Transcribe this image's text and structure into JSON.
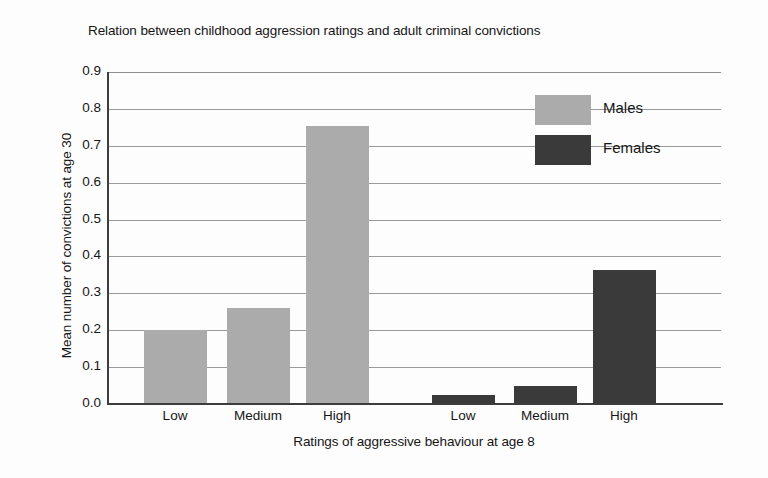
{
  "chart_data": {
    "type": "bar",
    "title": "Relation between childhood aggression ratings and adult criminal convictions",
    "xlabel": "Ratings of aggressive behaviour at age 8",
    "ylabel": "Mean number of convictions at age 30",
    "categories": [
      "Low",
      "Medium",
      "High"
    ],
    "series": [
      {
        "name": "Males",
        "values": [
          0.2,
          0.26,
          0.755
        ],
        "color": "#ababab"
      },
      {
        "name": "Females",
        "values": [
          0.025,
          0.05,
          0.363
        ],
        "color": "#3a3a3a"
      }
    ],
    "ylim": [
      0.0,
      0.9
    ],
    "ytick_labels": [
      "0.0",
      "0.1",
      "0.2",
      "0.3",
      "0.4",
      "0.5",
      "0.6",
      "0.7",
      "0.8",
      "0.9"
    ],
    "ytick_values": [
      0.0,
      0.1,
      0.2,
      0.3,
      0.4,
      0.5,
      0.6,
      0.7,
      0.8,
      0.9
    ],
    "xtick_labels": [
      "Low",
      "Medium",
      "High",
      "Low",
      "Medium",
      "High"
    ],
    "grid": true,
    "grid_axis": "y",
    "legend_position": "upper-right",
    "legend_entries": [
      "Males",
      "Females"
    ],
    "bars": [
      {
        "group": "Males",
        "category": "Low",
        "value": 0.2,
        "x_center": 175,
        "width": 63
      },
      {
        "group": "Males",
        "category": "Medium",
        "value": 0.26,
        "x_center": 258,
        "width": 63
      },
      {
        "group": "Males",
        "category": "High",
        "value": 0.755,
        "x_center": 337,
        "width": 63
      },
      {
        "group": "Females",
        "category": "Low",
        "value": 0.025,
        "x_center": 463,
        "width": 63
      },
      {
        "group": "Females",
        "category": "Medium",
        "value": 0.05,
        "x_center": 545,
        "width": 63
      },
      {
        "group": "Females",
        "category": "High",
        "value": 0.363,
        "x_center": 624,
        "width": 63
      }
    ]
  }
}
